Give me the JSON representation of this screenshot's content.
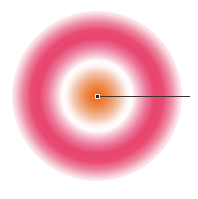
{
  "figure": {
    "title_remnant": "",
    "background_color": "#ffffff",
    "width": 198,
    "height": 199
  },
  "disc": {
    "center_x": 97,
    "center_y": 96,
    "radius": 85
  },
  "ray": {
    "label": "radius-ray",
    "start_x": 97,
    "start_y": 96,
    "end_x": 190,
    "end_y": 96,
    "color": "#3a3330",
    "thickness": 1
  },
  "center_marker": {
    "label": "origin-marker",
    "x": 97,
    "y": 96,
    "size": 3,
    "color": "#241f1d"
  },
  "chart_data": {
    "type": "heatmap",
    "subtype": "polar-radial",
    "title": "",
    "xlabel": "",
    "ylabel": "",
    "grid": false,
    "legend": "none",
    "colorbar": false,
    "axis_visible": false,
    "radial_axis": {
      "min": 0,
      "max": 1,
      "unit": "normalized radius"
    },
    "angular_axis": {
      "min": 0,
      "max": 360,
      "unit": "degrees"
    },
    "colors": {
      "core": "#f26b20",
      "node_white": "#ffffff",
      "ring_pink": "#e8456f",
      "edge_orange": "#e8501e",
      "background": "#ffffff"
    },
    "radial_profile": [
      {
        "r": 0.0,
        "color": "#f2681d",
        "band": "core-orange"
      },
      {
        "r": 0.06,
        "color": "#f07a33",
        "band": "core-orange"
      },
      {
        "r": 0.12,
        "color": "#ee9a63",
        "band": "core-orange"
      },
      {
        "r": 0.19,
        "color": "#f3c4ad",
        "band": "falloff"
      },
      {
        "r": 0.25,
        "color": "#fdf4f0",
        "band": "node-white"
      },
      {
        "r": 0.29,
        "color": "#ffffff",
        "band": "node-white"
      },
      {
        "r": 0.34,
        "color": "#f6c3d2",
        "band": "rise-pink"
      },
      {
        "r": 0.41,
        "color": "#ec789b",
        "band": "rise-pink"
      },
      {
        "r": 0.48,
        "color": "#e8456f",
        "band": "ring-pink"
      },
      {
        "r": 0.55,
        "color": "#e94a72",
        "band": "ring-pink"
      },
      {
        "r": 0.62,
        "color": "#ee8aa4",
        "band": "falloff"
      },
      {
        "r": 0.68,
        "color": "#f8d5dc",
        "band": "falloff"
      },
      {
        "r": 0.73,
        "color": "#ffffff",
        "band": "node-white"
      },
      {
        "r": 0.78,
        "color": "#fdf0e6",
        "band": "node-white"
      },
      {
        "r": 0.84,
        "color": "#f4c19a",
        "band": "rise-orange"
      },
      {
        "r": 0.9,
        "color": "#ef8f4c",
        "band": "rise-orange"
      },
      {
        "r": 0.96,
        "color": "#ea6124",
        "band": "edge-orange"
      },
      {
        "r": 1.0,
        "color": "#e8501e",
        "band": "edge-orange"
      }
    ],
    "rings": [
      {
        "name": "core",
        "inner_r": 0.0,
        "outer_r": 0.2,
        "dominant_color": "#f26b20"
      },
      {
        "name": "inner-white-node",
        "inner_r": 0.2,
        "outer_r": 0.33,
        "dominant_color": "#ffffff"
      },
      {
        "name": "pink-band",
        "inner_r": 0.33,
        "outer_r": 0.66,
        "dominant_color": "#e8456f"
      },
      {
        "name": "outer-white-node",
        "inner_r": 0.66,
        "outer_r": 0.8,
        "dominant_color": "#ffffff"
      },
      {
        "name": "outer-orange-band",
        "inner_r": 0.8,
        "outer_r": 1.0,
        "dominant_color": "#e8501e"
      }
    ]
  }
}
